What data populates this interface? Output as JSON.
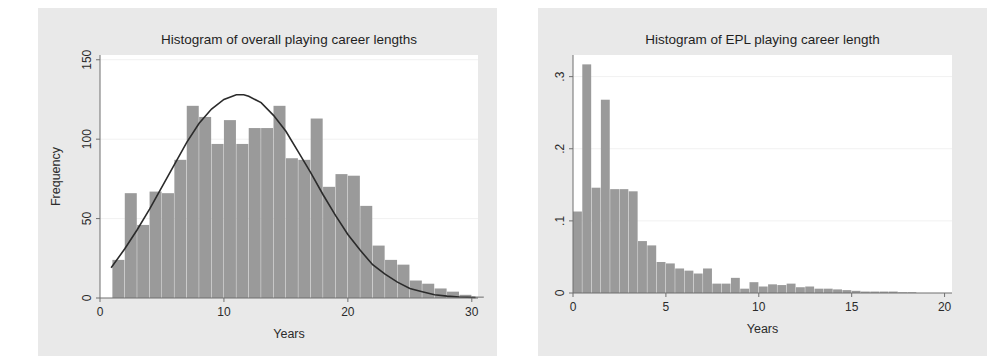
{
  "figure": {
    "background_color": "#e9e9e9",
    "plot_background_color": "#ffffff",
    "bar_color": "#9a9a9a",
    "curve_color": "#2b2b2b",
    "axis_color": "#6f6f6f"
  },
  "chart_data": [
    {
      "id": "overall-career-lengths",
      "type": "bar",
      "title": "Histogram of overall playing career lengths",
      "xlabel": "Years",
      "ylabel": "Frequency",
      "xlim": [
        0,
        30.5
      ],
      "ylim": [
        0,
        153
      ],
      "xticks": [
        0,
        10,
        20,
        30
      ],
      "xtick_labels": [
        "0",
        "10",
        "20",
        "30"
      ],
      "yticks": [
        0,
        50,
        100,
        150
      ],
      "ytick_labels": [
        "0",
        "50",
        "100",
        "150"
      ],
      "grid": true,
      "bin_width": 1,
      "bin_starts": [
        1,
        2,
        3,
        4,
        5,
        6,
        7,
        8,
        9,
        10,
        11,
        12,
        13,
        14,
        15,
        16,
        17,
        18,
        19,
        20,
        21,
        22,
        23,
        24,
        25,
        26,
        27,
        28,
        29,
        30
      ],
      "values": [
        24,
        66,
        46,
        67,
        66,
        87,
        121,
        114,
        97,
        112,
        97,
        107,
        107,
        121,
        88,
        87,
        113,
        70,
        78,
        77,
        58,
        33,
        24,
        21,
        11,
        9,
        6,
        4,
        2,
        1
      ],
      "overlay": {
        "name": "normal-density-curve",
        "type": "line",
        "peak_x": 11.6,
        "peak_y": 128,
        "points_x": [
          0.9,
          2,
          3,
          4,
          5,
          6,
          7,
          8,
          9,
          10,
          11,
          11.6,
          12,
          13,
          14,
          15,
          16,
          17,
          18,
          19,
          20,
          21,
          22,
          23,
          24,
          25,
          26,
          27,
          28,
          29,
          30.3
        ],
        "points_y": [
          19,
          31,
          43,
          56,
          70,
          84,
          98,
          110,
          119,
          125,
          128,
          128,
          127,
          123,
          115,
          105,
          92,
          79,
          65,
          52,
          40,
          30,
          21,
          15,
          10,
          6,
          4,
          2,
          1.2,
          0.6,
          0.3
        ]
      }
    },
    {
      "id": "epl-career-length",
      "type": "bar",
      "title": "Histogram of EPL playing career length",
      "xlabel": "Years",
      "ylabel": "Density",
      "xlim": [
        0,
        20.4
      ],
      "ylim": [
        0,
        0.33
      ],
      "xticks": [
        0,
        5,
        10,
        15,
        20
      ],
      "xtick_labels": [
        "0",
        "5",
        "10",
        "15",
        "20"
      ],
      "yticks": [
        0,
        0.1,
        0.2,
        0.3
      ],
      "ytick_labels": [
        "0",
        ".1",
        ".2",
        ".3"
      ],
      "grid": true,
      "bin_width": 0.5,
      "bin_starts": [
        0,
        0.5,
        1,
        1.5,
        2,
        2.5,
        3,
        3.5,
        4,
        4.5,
        5,
        5.5,
        6,
        6.5,
        7,
        7.5,
        8,
        8.5,
        9,
        9.5,
        10,
        10.5,
        11,
        11.5,
        12,
        12.5,
        13,
        13.5,
        14,
        14.5,
        15,
        15.5,
        16,
        16.5,
        17,
        17.5,
        18
      ],
      "values": [
        0.113,
        0.317,
        0.146,
        0.268,
        0.144,
        0.144,
        0.141,
        0.072,
        0.066,
        0.043,
        0.041,
        0.034,
        0.031,
        0.027,
        0.034,
        0.013,
        0.013,
        0.021,
        0.006,
        0.015,
        0.009,
        0.012,
        0.011,
        0.013,
        0.008,
        0.009,
        0.006,
        0.006,
        0.005,
        0.004,
        0.003,
        0.002,
        0.002,
        0.002,
        0.002,
        0.001,
        0.001
      ]
    }
  ]
}
